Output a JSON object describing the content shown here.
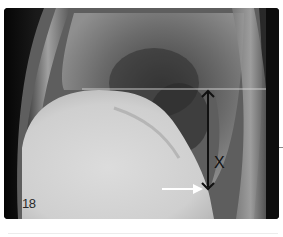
{
  "figure": {
    "number_label": "18",
    "measurement_label": "X",
    "annotations": {
      "horizontal_line": "reference line at level of diaphragm dome",
      "double_arrow": "vertical distance X",
      "white_arrow": "points to posterior costophrenic angle"
    },
    "colors": {
      "background": "#0b0b0b",
      "arrow": "#111111",
      "pointer": "#ffffff",
      "reference_line": "#d8d8d8"
    }
  }
}
